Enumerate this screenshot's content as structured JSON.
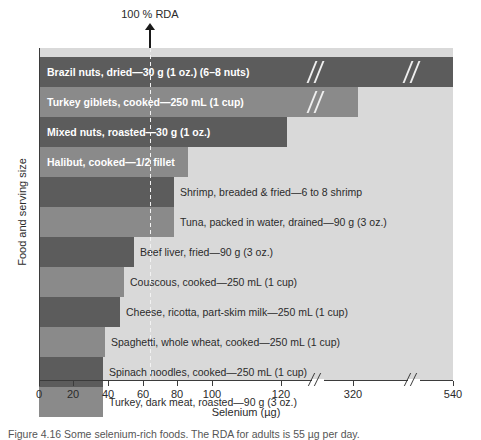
{
  "figure": {
    "rda_annotation": "100 % RDA",
    "caption": "Figure 4.16 Some selenium-rich foods. The RDA for adults is 55 µg per day."
  },
  "chart_data": {
    "type": "bar",
    "orientation": "horizontal",
    "title": "",
    "xlabel": "Selenium (µg)",
    "ylabel": "Food and serving size",
    "grid": false,
    "legend": "none",
    "axis_breaks": [
      130,
      340
    ],
    "rda_reference_value": 55,
    "rda_reference_label": "100 % RDA",
    "xticks": [
      0,
      20,
      40,
      60,
      80,
      100,
      120,
      320,
      540
    ],
    "xtick_labels": [
      "0",
      "20",
      "40",
      "60",
      "80",
      "100",
      "120",
      "320",
      "540"
    ],
    "xlim": [
      0,
      540
    ],
    "categories": [
      "Brazil nuts, dried—30 g (1 oz.) (6–8 nuts)",
      "Turkey giblets, cooked—250 mL (1 cup)",
      "Mixed nuts, roasted—30 g (1 oz.)",
      "Halibut, cooked—1/2 fillet",
      "Shrimp, breaded & fried—6 to 8 shrimp",
      "Tuna, packed in water, drained—90 g (3 oz.)",
      "Beef liver, fried—90 g (3 oz.)",
      "Couscous, cooked—250 mL (1 cup)",
      "Cheese, ricotta, part-skim milk—250 mL (1 cup)",
      "Spaghetti, whole wheat, cooked—250 mL (1 cup)",
      "Spinach noodles, cooked—250 mL (1 cup)",
      "Turkey, dark meat, roasted—90 g (3 oz.)"
    ],
    "values": [
      540,
      330,
      143,
      86,
      78,
      78,
      55,
      49,
      47,
      38,
      37,
      37
    ]
  },
  "bars": [
    {
      "label": "Brazil nuts, dried—30 g (1 oz.) (6–8 nuts)",
      "value": 540,
      "tone": "dark",
      "label_position": "inside",
      "px_width": 414
    },
    {
      "label": "Turkey giblets, cooked—250 mL (1 cup)",
      "value": 330,
      "tone": "light",
      "label_position": "inside",
      "px_width": 319
    },
    {
      "label": "Mixed nuts, roasted—30 g (1 oz.)",
      "value": 143,
      "tone": "dark",
      "label_position": "inside",
      "px_width": 248
    },
    {
      "label": "Halibut, cooked—1/2 fillet",
      "value": 86,
      "tone": "light",
      "label_position": "inside",
      "px_width": 149
    },
    {
      "label": "Shrimp, breaded & fried—6 to 8 shrimp",
      "value": 78,
      "tone": "dark",
      "label_position": "outside",
      "px_width": 135
    },
    {
      "label": "Tuna, packed in water, drained—90 g (3 oz.)",
      "value": 78,
      "tone": "light",
      "label_position": "outside",
      "px_width": 135
    },
    {
      "label": "Beef liver, fried—90 g (3 oz.)",
      "value": 55,
      "tone": "dark",
      "label_position": "outside",
      "px_width": 95
    },
    {
      "label": "Couscous, cooked—250 mL (1 cup)",
      "value": 49,
      "tone": "light",
      "label_position": "outside",
      "px_width": 85
    },
    {
      "label": "Cheese, ricotta, part-skim milk—250 mL (1 cup)",
      "value": 47,
      "tone": "dark",
      "label_position": "outside",
      "px_width": 81
    },
    {
      "label": "Spaghetti, whole wheat, cooked—250 mL (1 cup)",
      "value": 38,
      "tone": "light",
      "label_position": "outside",
      "px_width": 66
    },
    {
      "label": "Spinach noodles, cooked—250 mL (1 cup)",
      "value": 37,
      "tone": "dark",
      "label_position": "outside",
      "px_width": 64
    },
    {
      "label": "Turkey, dark meat, roasted—90 g (3 oz.)",
      "value": 37,
      "tone": "light",
      "label_position": "outside",
      "px_width": 64
    }
  ],
  "xaxis": {
    "ticks": [
      {
        "label": "0",
        "px": 0
      },
      {
        "label": "20",
        "px": 34
      },
      {
        "label": "40",
        "px": 69
      },
      {
        "label": "60",
        "px": 104
      },
      {
        "label": "80",
        "px": 138
      },
      {
        "label": "100",
        "px": 173
      },
      {
        "label": "120",
        "px": 242
      },
      {
        "label": "320",
        "px": 314
      },
      {
        "label": "540",
        "px": 414
      }
    ],
    "breaks_px": [
      272,
      368
    ],
    "title": "Selenium (µg)"
  },
  "colors": {
    "plot_background": "#d9d9d9",
    "bar_dark": "#5c5c5c",
    "bar_light": "#8a8a8a",
    "axis": "#3b3b3b",
    "text": "#2b2b2b",
    "label_inside": "#ffffff",
    "page_background": "#ffffff"
  }
}
